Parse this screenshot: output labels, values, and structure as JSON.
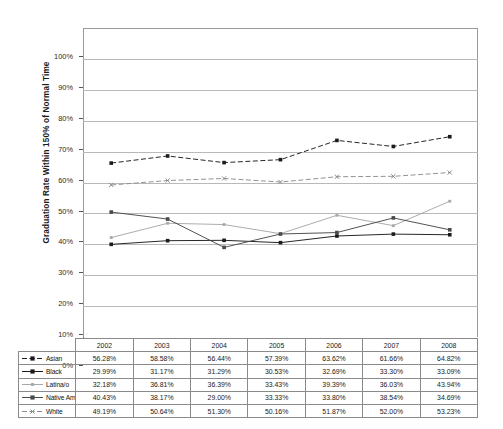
{
  "chart_data": {
    "type": "line",
    "title": "",
    "xlabel": "",
    "ylabel": "Graduation Rate Within 150% of Normal Time",
    "ylim": [
      0,
      100
    ],
    "ytick_labels": [
      "100%",
      "90%",
      "80%",
      "70%",
      "60%",
      "50%",
      "40%",
      "30%",
      "20%",
      "10%",
      "0%"
    ],
    "ytick_values": [
      100,
      90,
      80,
      70,
      60,
      50,
      40,
      30,
      20,
      10,
      0
    ],
    "grid": true,
    "legend_position": "table-left",
    "categories": [
      "2002",
      "2003",
      "2004",
      "2005",
      "2006",
      "2007",
      "2008"
    ],
    "series": [
      {
        "name": "Asian",
        "color": "#1b1b1b",
        "marker": "filled-square",
        "line_style": "dash-dot",
        "values": [
          56.28,
          58.58,
          56.44,
          57.39,
          63.62,
          61.66,
          64.82
        ],
        "labels": [
          "56.28%",
          "58.58%",
          "56.44%",
          "57.39%",
          "63.62%",
          "61.66%",
          "64.82%"
        ]
      },
      {
        "name": "Black",
        "color": "#1b1b1b",
        "marker": "filled-square",
        "line_style": "solid",
        "values": [
          29.99,
          31.17,
          31.29,
          30.53,
          32.69,
          33.3,
          33.09
        ],
        "labels": [
          "29.99%",
          "31.17%",
          "31.29%",
          "30.53%",
          "32.69%",
          "33.30%",
          "33.09%"
        ]
      },
      {
        "name": "Latina/o",
        "color": "#a8a8a8",
        "marker": "small-square",
        "line_style": "solid",
        "values": [
          32.18,
          36.81,
          36.39,
          33.43,
          39.39,
          36.03,
          43.94
        ],
        "labels": [
          "32.18%",
          "36.81%",
          "36.39%",
          "33.43%",
          "39.39%",
          "36.03%",
          "43.94%"
        ]
      },
      {
        "name": "Native American",
        "color": "#4a4a4a",
        "marker": "filled-square",
        "line_style": "solid",
        "values": [
          40.43,
          38.17,
          29.0,
          33.33,
          33.8,
          38.54,
          34.69
        ],
        "labels": [
          "40.43%",
          "38.17%",
          "29.00%",
          "33.33%",
          "33.80%",
          "38.54%",
          "34.69%"
        ]
      },
      {
        "name": "White",
        "color": "#8d8d8d",
        "marker": "x",
        "line_style": "dash-dot",
        "values": [
          49.19,
          50.64,
          51.3,
          50.16,
          51.87,
          52.0,
          53.23
        ],
        "labels": [
          "49.19%",
          "50.64%",
          "51.30%",
          "50.16%",
          "51.87%",
          "52.00%",
          "53.23%"
        ]
      }
    ]
  }
}
